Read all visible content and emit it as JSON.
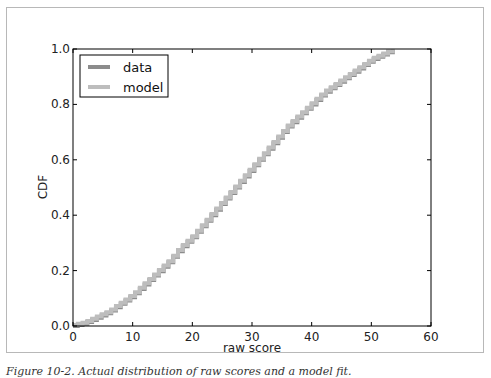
{
  "figure": {
    "caption": "Figure 10-2. Actual distribution of raw scores and a model fit."
  },
  "chart_data": {
    "type": "line",
    "title": "",
    "xlabel": "raw score",
    "ylabel": "CDF",
    "xlim": [
      0,
      60
    ],
    "ylim": [
      0.0,
      1.0
    ],
    "xticks": [
      "0",
      "10",
      "20",
      "30",
      "40",
      "50",
      "60"
    ],
    "yticks": [
      "0.0",
      "0.2",
      "0.4",
      "0.6",
      "0.8",
      "1.0"
    ],
    "grid": false,
    "legend_position": "upper left",
    "series": [
      {
        "name": "data",
        "color": "#8c8c8c",
        "style": "step",
        "x": [
          0,
          2,
          4,
          6,
          8,
          10,
          12,
          14,
          16,
          18,
          20,
          22,
          24,
          26,
          28,
          30,
          32,
          34,
          36,
          38,
          40,
          42,
          44,
          46,
          48,
          50,
          52,
          54
        ],
        "y": [
          0.0,
          0.01,
          0.03,
          0.05,
          0.08,
          0.11,
          0.15,
          0.19,
          0.23,
          0.28,
          0.32,
          0.37,
          0.42,
          0.47,
          0.52,
          0.57,
          0.62,
          0.67,
          0.72,
          0.76,
          0.8,
          0.84,
          0.87,
          0.9,
          0.93,
          0.96,
          0.98,
          1.0
        ]
      },
      {
        "name": "model",
        "color": "#bdbdbd",
        "style": "step",
        "x": [
          0,
          2,
          4,
          6,
          8,
          10,
          12,
          14,
          16,
          18,
          20,
          22,
          24,
          26,
          28,
          30,
          32,
          34,
          36,
          38,
          40,
          42,
          44,
          46,
          48,
          50,
          52,
          54
        ],
        "y": [
          0.0,
          0.01,
          0.03,
          0.05,
          0.08,
          0.11,
          0.15,
          0.19,
          0.23,
          0.28,
          0.32,
          0.37,
          0.42,
          0.47,
          0.52,
          0.57,
          0.62,
          0.67,
          0.72,
          0.76,
          0.8,
          0.84,
          0.87,
          0.9,
          0.93,
          0.96,
          0.98,
          1.0
        ]
      }
    ]
  }
}
